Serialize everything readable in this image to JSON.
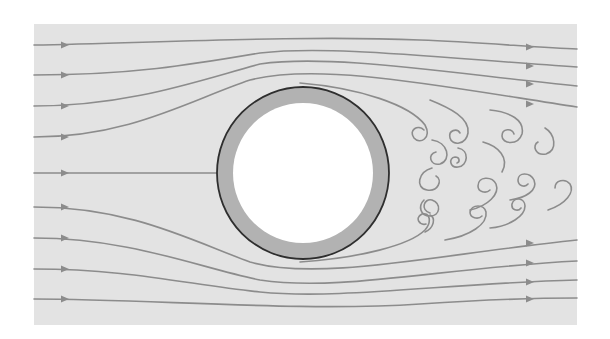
{
  "diagram": {
    "title": "Flow past a circular cylinder with vortex wake",
    "canvas": {
      "width": 610,
      "height": 339,
      "page_bg": "#ffffff"
    },
    "field": {
      "x": 34,
      "y": 24,
      "width": 543,
      "height": 301,
      "fill": "#e3e3e3"
    },
    "colors": {
      "streamline": "#8c8c8c",
      "cylinder_ring": "#b2b2b2",
      "cylinder_outline": "#2e2e2e",
      "cylinder_core": "#ffffff",
      "vortex": "#8c8c8c"
    },
    "cylinder": {
      "cx": 303,
      "cy": 173,
      "r_outer": 86,
      "r_inner": 70
    },
    "streamlines": [
      {
        "id": "top-1",
        "d": "M34,45 C150,43 300,35 420,40 C480,42 540,48 577,49",
        "arrows": [
          [
            65,
            45
          ],
          [
            530,
            47
          ]
        ]
      },
      {
        "id": "top-2",
        "d": "M34,75 C130,75 190,65 260,53 C330,45 440,58 577,67",
        "arrows": [
          [
            65,
            75
          ],
          [
            530,
            66
          ]
        ]
      },
      {
        "id": "top-3",
        "d": "M34,106 C130,106 200,80 260,64 C330,54 440,72 577,86",
        "arrows": [
          [
            65,
            106
          ],
          [
            530,
            84
          ]
        ]
      },
      {
        "id": "top-4",
        "d": "M34,137 C130,137 190,100 250,80 C320,62 440,86 577,107",
        "arrows": [
          [
            65,
            137
          ],
          [
            530,
            104
          ]
        ]
      },
      {
        "id": "top-5-wake",
        "d": "M300,83 C360,88 410,105 425,125 C432,138 420,145 414,138 C408,130 418,124 424,130",
        "arrows": []
      },
      {
        "id": "center",
        "d": "M34,173 L217,173",
        "arrows": [
          [
            65,
            173
          ]
        ]
      },
      {
        "id": "bottom-5-wake",
        "d": "M300,262 C360,258 410,245 425,230 C432,222 430,212 422,214 C414,218 420,226 426,224",
        "arrows": []
      },
      {
        "id": "bottom-4",
        "d": "M34,207 C130,207 190,240 250,262 C320,282 440,254 577,240",
        "arrows": [
          [
            65,
            207
          ],
          [
            530,
            243
          ]
        ]
      },
      {
        "id": "bottom-3",
        "d": "M34,238 C130,238 200,268 260,280 C340,292 440,268 577,261",
        "arrows": [
          [
            65,
            238
          ],
          [
            530,
            263
          ]
        ]
      },
      {
        "id": "bottom-2",
        "d": "M34,269 C130,269 190,285 260,292 C340,300 450,283 577,280",
        "arrows": [
          [
            65,
            269
          ],
          [
            530,
            282
          ]
        ]
      },
      {
        "id": "bottom-1",
        "d": "M34,299 C150,299 300,312 420,304 C480,300 540,298 577,298",
        "arrows": [
          [
            65,
            299
          ],
          [
            530,
            299
          ]
        ]
      }
    ],
    "vortices": [
      {
        "id": "v1",
        "d": "M432,140 C448,142 452,160 440,164 C430,166 427,154 436,152"
      },
      {
        "id": "v2",
        "d": "M432,168 C418,172 415,188 427,190 C438,192 443,180 436,176"
      },
      {
        "id": "v3",
        "d": "M430,100 C450,108 470,118 468,133 C466,145 452,146 450,138 C448,130 457,128 460,133"
      },
      {
        "id": "v4",
        "d": "M458,148 C470,150 468,166 458,167 C450,168 448,158 455,157 C460,157 460,162 457,163"
      },
      {
        "id": "v5",
        "d": "M490,110 C510,112 525,120 522,134 C518,146 502,144 502,136 C502,128 512,128 514,134"
      },
      {
        "id": "v6",
        "d": "M483,142 C498,146 510,158 502,172"
      },
      {
        "id": "v7",
        "d": "M545,128 C555,134 558,150 546,154 C535,156 532,145 538,142"
      },
      {
        "id": "v8",
        "d": "M470,210 C488,206 500,194 496,184 C492,176 478,176 478,186 C478,192 486,194 490,190"
      },
      {
        "id": "v9",
        "d": "M510,200 C526,198 538,190 534,180 C530,172 518,172 518,180 C518,186 525,188 528,184"
      },
      {
        "id": "v10",
        "d": "M424,200 C418,206 420,216 430,216 C440,216 442,204 432,200 C424,198 420,210 430,213"
      },
      {
        "id": "v11",
        "d": "M445,240 C470,236 488,224 486,212 C484,204 472,204 470,212 C470,218 478,220 482,216"
      },
      {
        "id": "v12",
        "d": "M490,228 C510,226 525,216 525,206 C525,198 514,196 512,204 C511,210 518,212 521,208"
      },
      {
        "id": "v13",
        "d": "M548,210 C566,204 575,192 570,184 C565,178 555,180 555,188"
      },
      {
        "id": "v14",
        "d": "M425,232 C434,228 436,218 430,215"
      }
    ]
  }
}
